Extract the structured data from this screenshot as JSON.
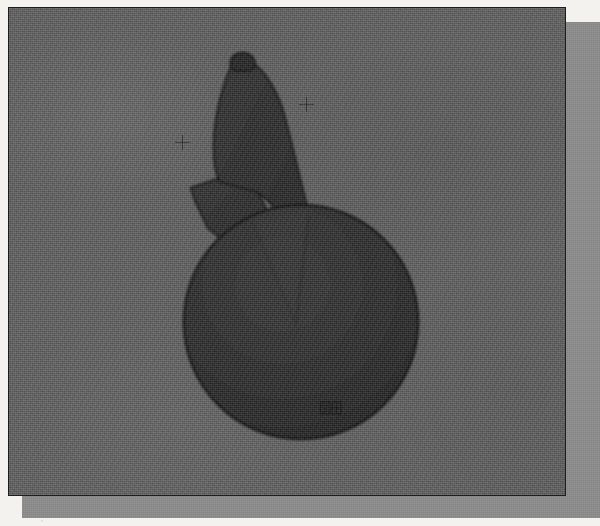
{
  "document": {
    "kind": "radiograph-plate-scan",
    "caption": "Grayscale radiographic plate showing a dark opaque object silhouette on a mottled gray film background"
  },
  "plate": {
    "background_color": "#5e5e5e",
    "border_color": "#1d1d1d",
    "mount_color": "#8d8d8d",
    "page_color": "#f4f2ee"
  },
  "subject": {
    "label": "object-silhouette",
    "fill_color": "#2a2a2a",
    "outline_color": "#141414",
    "parts": [
      {
        "name": "apex-nub",
        "label": "Apex nub"
      },
      {
        "name": "upper-body",
        "label": "Upper elongated body"
      },
      {
        "name": "side-flange",
        "label": "Left side flange"
      },
      {
        "name": "disc",
        "label": "Circular disc base"
      },
      {
        "name": "wedge-seam",
        "label": "Interior wedge seam"
      }
    ]
  },
  "markers": {
    "fiducials": [
      {
        "name": "fiducial-left",
        "label": "Registration cross (left)",
        "x": 173,
        "y": 134
      },
      {
        "name": "fiducial-right",
        "label": "Registration cross (right)",
        "x": 297,
        "y": 96
      }
    ],
    "seal": {
      "name": "seal-stamp",
      "label": "Stamp impression",
      "x": 318,
      "y": 398
    }
  }
}
